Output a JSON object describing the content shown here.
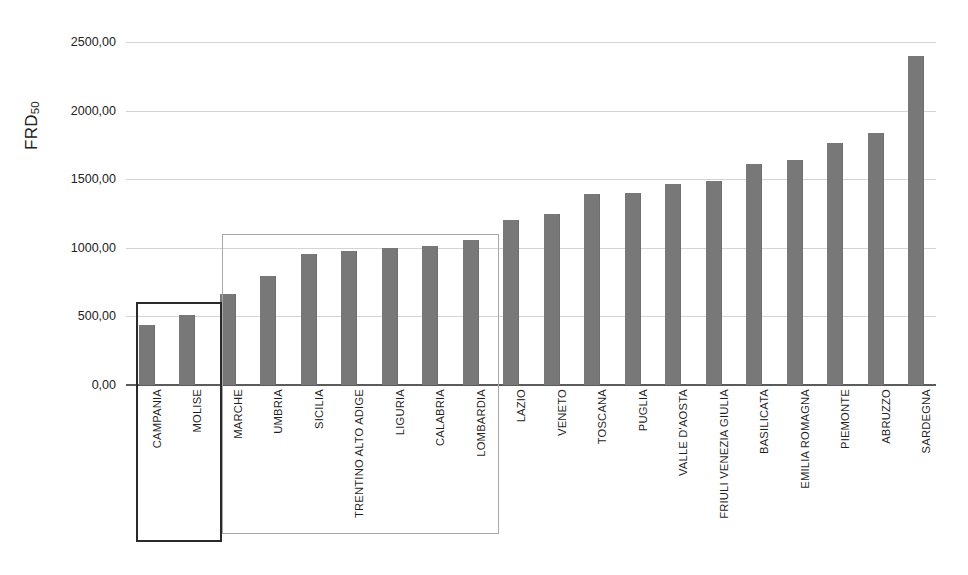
{
  "chart_data": {
    "type": "bar",
    "title": "",
    "subtitle": "",
    "xlabel": "",
    "ylabel": "FRD",
    "ylabel_subscript": "50",
    "ylim": [
      0,
      2500
    ],
    "ytick_labels": [
      "2500,00",
      "2000,00",
      "1500,00",
      "1000,00",
      "500,00",
      "0,00"
    ],
    "ytick_values": [
      2500,
      2000,
      1500,
      1000,
      500,
      0
    ],
    "grid": true,
    "legend": "none",
    "bar_color": "#787878",
    "categories": [
      "CAMPANIA",
      "MOLISE",
      "MARCHE",
      "UMBRIA",
      "SICILIA",
      "TRENTINO ALTO ADIGE",
      "LIGURIA",
      "CALABRIA",
      "LOMBARDIA",
      "LAZIO",
      "VENETO",
      "TOSCANA",
      "PUGLIA",
      "VALLE D'AOSTA",
      "FRIULI VENEZIA GIULIA",
      "BASILICATA",
      "EMILIA ROMAGNA",
      "PIEMONTE",
      "ABRUZZO",
      "SARDEGNA"
    ],
    "values": [
      440,
      510,
      660,
      795,
      955,
      975,
      1000,
      1015,
      1060,
      1200,
      1245,
      1390,
      1400,
      1465,
      1490,
      1610,
      1640,
      1765,
      1840,
      2395
    ],
    "annotations": [
      {
        "name": "group-box-low",
        "label": "",
        "members": [
          "CAMPANIA",
          "MOLISE"
        ],
        "border_color": "#2a2a2a"
      },
      {
        "name": "group-box-mid",
        "label": "",
        "members": [
          "MARCHE",
          "UMBRIA",
          "SICILIA",
          "TRENTINO ALTO ADIGE",
          "LIGURIA",
          "CALABRIA",
          "LOMBARDIA"
        ],
        "border_color": "#a8a8a8"
      }
    ]
  }
}
